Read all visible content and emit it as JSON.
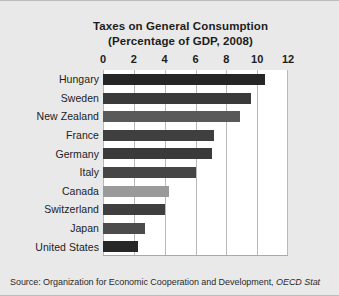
{
  "figure": {
    "title_line1": "Taxes on General Consumption",
    "title_line2": "(Percentage of GDP, 2008)",
    "source_prefix": "Source: Organization for Economic Cooperation and Development, ",
    "source_italic": "OECD Stat",
    "background_color": "#e9e9e9",
    "plot_background_color": "#ffffff",
    "gridline_color": "#b9b9b9"
  },
  "chart_data": {
    "type": "bar",
    "orientation": "horizontal",
    "title": "Taxes on General Consumption (Percentage of GDP, 2008)",
    "xlabel": "",
    "ylabel": "",
    "xlim": [
      0,
      12
    ],
    "xticks": [
      0,
      2,
      4,
      6,
      8,
      10,
      12
    ],
    "xtick_labels": [
      "0",
      "2",
      "4",
      "6",
      "8",
      "10",
      "12"
    ],
    "grid": true,
    "legend": "none",
    "categories": [
      "Hungary",
      "Sweden",
      "New Zealand",
      "France",
      "Germany",
      "Italy",
      "Canada",
      "Switzerland",
      "Japan",
      "United States"
    ],
    "values": [
      10.5,
      9.6,
      8.9,
      7.2,
      7.1,
      6.0,
      4.3,
      4.0,
      2.7,
      2.3
    ],
    "bar_colors": [
      "#262626",
      "#3a3a3a",
      "#595959",
      "#3f3f3f",
      "#3a3a3a",
      "#464646",
      "#9a9a9a",
      "#3f3f3f",
      "#4c4c4c",
      "#272727"
    ]
  }
}
